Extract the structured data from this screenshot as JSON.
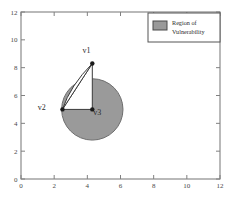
{
  "chart_data": {
    "type": "scatter",
    "title": "",
    "xlabel": "",
    "ylabel": "",
    "xlim": [
      0,
      12
    ],
    "ylim": [
      0,
      12
    ],
    "xticks": [
      0,
      2,
      4,
      6,
      8,
      10,
      12
    ],
    "yticks": [
      0,
      2,
      4,
      6,
      8,
      10,
      12
    ],
    "xticklabels": [
      "0",
      "2",
      "4",
      "6",
      "8",
      "10",
      "12"
    ],
    "yticklabels": [
      "0",
      "2",
      "4",
      "6",
      "8",
      "10",
      "12"
    ],
    "grid": false,
    "legend": {
      "position": "upper-right",
      "entries": [
        {
          "label_line1": "Region of",
          "label_line2": "Vulnerability",
          "swatch_color": "#9a9a9a",
          "type": "patch"
        }
      ]
    },
    "shapes": [
      {
        "name": "region-of-vulnerability",
        "type": "circle",
        "cx": 4.3,
        "cy": 5.0,
        "r": 1.85,
        "fill": "#9a9a9a",
        "stroke": "#6e6e6e"
      },
      {
        "name": "triangle-v1-v2-v3",
        "type": "polygon",
        "points": [
          [
            4.3,
            8.3
          ],
          [
            2.5,
            5.0
          ],
          [
            4.3,
            5.0
          ]
        ],
        "fill": "#ffffff",
        "stroke": "#3a3a3a"
      },
      {
        "name": "arc-v1-to-v2",
        "type": "arc",
        "from": [
          4.3,
          8.3
        ],
        "to": [
          2.5,
          5.0
        ],
        "fill": "#ffffff",
        "stroke": "#3a3a3a"
      }
    ],
    "points": [
      {
        "name": "v1",
        "label": "v1",
        "x": 4.3,
        "y": 8.3,
        "label_dx": -0.35,
        "label_dy": 0.95,
        "marker": "filled-circle",
        "color": "#1a1a1a"
      },
      {
        "name": "v2",
        "label": "v2",
        "x": 2.5,
        "y": 5.0,
        "label_dx": -1.25,
        "label_dy": 0.15,
        "marker": "filled-circle",
        "color": "#1a1a1a"
      },
      {
        "name": "v3",
        "label": "v3",
        "x": 4.3,
        "y": 5.0,
        "label_dx": 0.3,
        "label_dy": -0.15,
        "marker": "filled-circle",
        "color": "#1a1a1a"
      }
    ],
    "axis_color": "#808080",
    "background": "#ffffff"
  }
}
